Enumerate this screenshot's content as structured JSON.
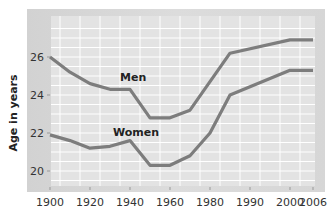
{
  "chart_data": {
    "type": "line",
    "title": "",
    "xlabel": "",
    "ylabel": "Age in years",
    "x": [
      1900,
      1910,
      1920,
      1930,
      1940,
      1950,
      1960,
      1970,
      1980,
      1985,
      2000,
      2006
    ],
    "x_tick_labels": [
      "1900",
      "1920",
      "1940",
      "1960",
      "1980",
      "1990",
      "2000",
      "2006"
    ],
    "y_tick_labels": [
      "20",
      "22",
      "24",
      "26"
    ],
    "ylim": [
      19,
      27.5
    ],
    "grid": true,
    "legend": "inline labels",
    "series": [
      {
        "name": "Men",
        "values": [
          26.0,
          25.2,
          24.6,
          24.3,
          24.3,
          22.8,
          22.8,
          23.2,
          24.7,
          26.2,
          26.9,
          26.9
        ]
      },
      {
        "name": "Women",
        "values": [
          21.9,
          21.6,
          21.2,
          21.3,
          21.6,
          20.3,
          20.3,
          20.8,
          22.0,
          24.0,
          25.3,
          25.3
        ]
      }
    ]
  },
  "axes": {
    "ylabel": "Age in years",
    "x_ticks": [
      {
        "label": "1900",
        "px": 50
      },
      {
        "label": "1920",
        "px": 90
      },
      {
        "label": "1940",
        "px": 130
      },
      {
        "label": "1960",
        "px": 170
      },
      {
        "label": "1980",
        "px": 210
      },
      {
        "label": "1990",
        "px": 250
      },
      {
        "label": "2000",
        "px": 290
      },
      {
        "label": "2006",
        "px": 313
      }
    ],
    "y_ticks": [
      {
        "label": "26",
        "value": 26
      },
      {
        "label": "24",
        "value": 24
      },
      {
        "label": "22",
        "value": 22
      },
      {
        "label": "20",
        "value": 20
      }
    ]
  },
  "labels": {
    "men": "Men",
    "women": "Women"
  },
  "colors": {
    "line": "#7d7d7d",
    "plot_bg": "#e3e3e3",
    "grid": "#ffffff"
  }
}
